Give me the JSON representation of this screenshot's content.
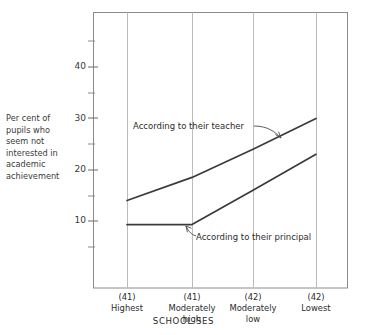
{
  "chart_data": {
    "type": "line",
    "title": "",
    "subtitle": "",
    "xlabel": "SCHOOL SES",
    "ylabel": "Per cent of pupils who seem not interested in academic achievement",
    "categories": [
      "Highest",
      "Moderately high",
      "Moderately low",
      "Lowest"
    ],
    "category_counts": [
      "(41)",
      "(41)",
      "(42)",
      "(42)"
    ],
    "series": [
      {
        "name": "According to their teacher",
        "values": [
          14,
          18.5,
          24,
          30
        ]
      },
      {
        "name": "According to their principal",
        "values": [
          9.3,
          9.3,
          16,
          23
        ]
      }
    ],
    "ylim": [
      0,
      48
    ],
    "yticks": [
      10,
      20,
      30,
      40
    ],
    "yticks_minor": [
      5,
      15,
      25,
      35,
      45
    ],
    "ytick_labels": [
      "10",
      "20",
      "30",
      "40"
    ],
    "grid": "vertical",
    "legend": "annotations",
    "annotations": [
      {
        "text": "According to their teacher",
        "points_to": "upper-line"
      },
      {
        "text": "According to their principal",
        "points_to": "lower-line-kink"
      }
    ],
    "colors": {
      "line": "#3a3a3a",
      "grid": "#b8b8b8",
      "frame": "#8a8a8a",
      "text": "#2b2b2b"
    }
  },
  "ylabel_lines": [
    "Per cent of",
    "pupils who",
    "seem not",
    "interested in",
    "academic",
    "achievement"
  ],
  "xaxis": {
    "title": "SCHOOL SES",
    "ticks": [
      {
        "count": "(41)",
        "line1": "Highest",
        "line2": ""
      },
      {
        "count": "(41)",
        "line1": "Moderately",
        "line2": "high"
      },
      {
        "count": "(42)",
        "line1": "Moderately",
        "line2": "low"
      },
      {
        "count": "(42)",
        "line1": "Lowest",
        "line2": ""
      }
    ]
  },
  "yaxis": {
    "labels": [
      "40",
      "30",
      "20",
      "10"
    ]
  },
  "annotations": {
    "teacher": "According to their teacher",
    "principal": "According to their principal"
  }
}
